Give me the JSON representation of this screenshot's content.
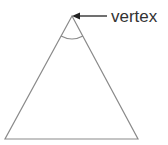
{
  "diagram": {
    "type": "triangle",
    "annotation": {
      "label": "vertex",
      "target": "apex"
    },
    "colors": {
      "stroke": "#8a8a8a",
      "arrow": "#222222",
      "text": "#333333",
      "background": "#ffffff"
    }
  }
}
